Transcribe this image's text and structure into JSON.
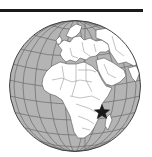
{
  "map": {
    "type": "orthographic-globe",
    "center_region": "Africa",
    "visible_regions": [
      "Europe",
      "Africa",
      "Middle East",
      "Arabian Peninsula",
      "Atlantic Ocean",
      "Indian Ocean"
    ],
    "marker": {
      "shape": "star",
      "location": "East Africa coast (Tanzania/Kenya)",
      "color": "#1a1a1a"
    },
    "graticule": true,
    "colors": {
      "ocean": "#b4b4b4",
      "land": "#ffffff",
      "border": "#555555",
      "graticule": "#6a6a6a",
      "outline": "#444444"
    }
  },
  "top_rule": {
    "color": "#1a1a1a"
  }
}
